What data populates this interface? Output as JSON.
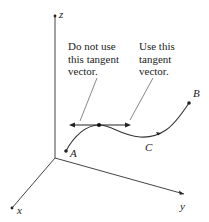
{
  "figure": {
    "axes": {
      "x_label": "x",
      "y_label": "y",
      "z_label": "z"
    },
    "points": {
      "A": "A",
      "B": "B",
      "C": "C"
    },
    "annotations": {
      "do_not_use": "Do not use\nthis tangent\nvector.",
      "use_this": "Use this\ntangent\nvector."
    },
    "colors": {
      "line": "#333333",
      "text": "#222222",
      "leader": "#555555"
    }
  }
}
